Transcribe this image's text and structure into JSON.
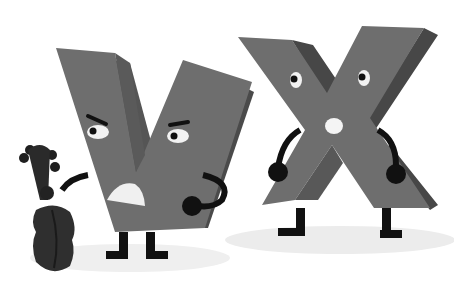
{
  "scene": {
    "title": "Cartoon letters V and X",
    "characters": [
      {
        "letter": "V",
        "expression": "grumpy",
        "prop": "violin"
      },
      {
        "letter": "X",
        "expression": "surprised",
        "prop": null
      }
    ]
  },
  "colors": {
    "background": "#ffffff",
    "letter_face": "#6e6e6e",
    "letter_side": "#4f4f4f",
    "letter_side_dark": "#444444",
    "limbs": "#111111",
    "eye_white": "#f2f2f2",
    "shadow": "#ececec",
    "violin": "#2a2a2a"
  }
}
